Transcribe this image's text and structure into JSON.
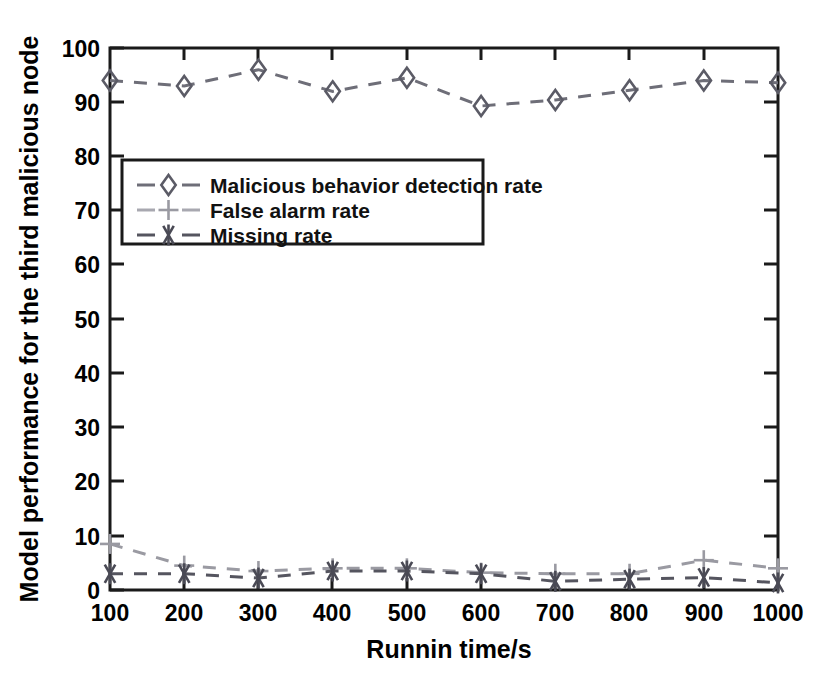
{
  "chart_data": {
    "type": "line",
    "title": "",
    "xlabel": "Runnin time/s",
    "ylabel": "Model performance for the third malicious node",
    "x": [
      100,
      200,
      300,
      400,
      500,
      600,
      700,
      800,
      900,
      1000
    ],
    "xlim": [
      100,
      1000
    ],
    "ylim": [
      0,
      100
    ],
    "xticks": [
      "100",
      "200",
      "300",
      "400",
      "500",
      "600",
      "700",
      "800",
      "900",
      "1000"
    ],
    "yticks": [
      "0",
      "10",
      "20",
      "30",
      "40",
      "50",
      "60",
      "70",
      "80",
      "90",
      "100"
    ],
    "grid": false,
    "legend_position": "upper-left-inside",
    "series": [
      {
        "name": "Malicious behavior detection rate",
        "marker": "diamond",
        "linestyle": "dashed",
        "color": "#5b5b66",
        "values": [
          94.0,
          93.0,
          96.0,
          92.0,
          94.5,
          89.3,
          90.4,
          92.2,
          94.0,
          93.6
        ]
      },
      {
        "name": "False alarm rate",
        "marker": "plus",
        "linestyle": "dashed",
        "color": "#9a9aa2",
        "values": [
          8.5,
          4.5,
          3.5,
          4.0,
          4.0,
          3.2,
          3.0,
          3.0,
          5.5,
          4.0
        ]
      },
      {
        "name": "Missing rate",
        "marker": "asterisk",
        "linestyle": "dashed",
        "color": "#4a4a55",
        "values": [
          3.0,
          3.0,
          2.2,
          3.5,
          3.5,
          3.0,
          1.6,
          2.0,
          2.3,
          1.3
        ]
      }
    ]
  },
  "axes": {
    "x_title": "Runnin time/s",
    "y_title": "Model performance for the third malicious node"
  },
  "legend": {
    "entries": [
      {
        "label": "Malicious behavior detection rate",
        "marker": "diamond"
      },
      {
        "label": "False alarm rate",
        "marker": "plus"
      },
      {
        "label": "Missing rate",
        "marker": "asterisk"
      }
    ]
  }
}
